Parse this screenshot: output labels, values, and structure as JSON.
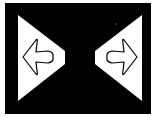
{
  "image": {
    "description": "Black rectangular panel with two white triangles pointing inward, each containing an outlined arrow",
    "colors": {
      "background": "#ffffff",
      "panel": "#000000",
      "triangle": "#ffffff",
      "arrow_outline": "#000000",
      "arrow_fill": "#ffffff"
    },
    "icons": [
      {
        "name": "left-arrow-icon",
        "direction": "left"
      },
      {
        "name": "right-arrow-icon",
        "direction": "right"
      }
    ]
  }
}
